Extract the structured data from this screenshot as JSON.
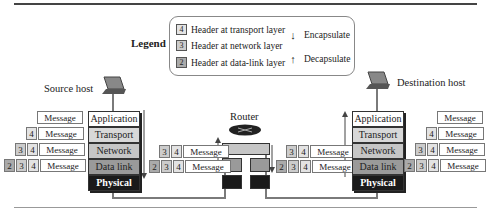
{
  "legend": {
    "title": "Legend",
    "headers": [
      {
        "num": "4",
        "label": "Header at transport layer"
      },
      {
        "num": "3",
        "label": "Header at network layer"
      },
      {
        "num": "2",
        "label": "Header at data-link layer"
      }
    ],
    "arrows": [
      {
        "icon": "arrow-down",
        "glyph": "↓",
        "label": "Encapsulate"
      },
      {
        "icon": "arrow-up",
        "glyph": "↑",
        "label": "Decapsulate"
      }
    ]
  },
  "source": {
    "label": "Source host",
    "layers": [
      "Application",
      "Transport",
      "Network",
      "Data link",
      "Physical"
    ],
    "packets": [
      {
        "headers": [],
        "message": "Message"
      },
      {
        "headers": [
          "4"
        ],
        "message": "Message"
      },
      {
        "headers": [
          "3",
          "4"
        ],
        "message": "Message"
      },
      {
        "headers": [
          "2",
          "3",
          "4"
        ],
        "message": "Message"
      }
    ]
  },
  "router": {
    "label": "Router",
    "packets_in": [
      {
        "headers": [
          "3",
          "4"
        ],
        "message": "Message"
      },
      {
        "headers": [
          "2",
          "3",
          "4"
        ],
        "message": "Message"
      }
    ],
    "packets_out": [
      {
        "headers": [
          "3",
          "4"
        ],
        "message": "Message"
      },
      {
        "headers": [
          "2",
          "3",
          "4"
        ],
        "message": "Message"
      }
    ]
  },
  "destination": {
    "label": "Destination host",
    "layers": [
      "Application",
      "Transport",
      "Network",
      "Data link",
      "Physical"
    ],
    "packets": [
      {
        "headers": [],
        "message": "Message"
      },
      {
        "headers": [
          "4"
        ],
        "message": "Message"
      },
      {
        "headers": [
          "3",
          "4"
        ],
        "message": "Message"
      },
      {
        "headers": [
          "2",
          "3",
          "4"
        ],
        "message": "Message"
      }
    ]
  },
  "colors": {
    "path": "#7a7a7a",
    "physical": "#1a1a1a"
  }
}
